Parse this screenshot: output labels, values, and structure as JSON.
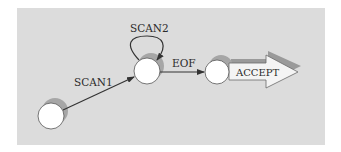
{
  "diagram": {
    "type": "state-machine",
    "colors": {
      "panel": "#dcdcdc",
      "node_fill": "#ffffff",
      "node_stroke": "#555555",
      "shadow": "#a6a6a6",
      "edge": "#333333",
      "text": "#2b2b2b",
      "accept_arrow_fill": "#f4f4f4",
      "accept_arrow_shadow": "#9a9a9a"
    },
    "nodes": [
      {
        "id": "start",
        "cx": 51,
        "cy": 116,
        "r": 13
      },
      {
        "id": "scan",
        "cx": 147,
        "cy": 71,
        "r": 13
      },
      {
        "id": "eof",
        "cx": 217,
        "cy": 72,
        "r": 12
      }
    ],
    "edges": [
      {
        "from": "start",
        "to": "scan",
        "label": "SCAN1"
      },
      {
        "from": "scan",
        "to": "scan",
        "label": "SCAN2"
      },
      {
        "from": "scan",
        "to": "eof",
        "label": "EOF"
      }
    ],
    "accept_label": "ACCEPT"
  }
}
